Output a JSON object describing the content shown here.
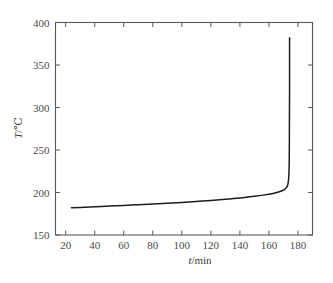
{
  "figure": {
    "background_color": "#ffffff",
    "axis_color": "#585858",
    "curve_color": "#1d1d1d"
  },
  "chart_data": {
    "type": "line",
    "title": "",
    "xlabel": "t/min",
    "ylabel": "T/℃",
    "xlabel_parts": {
      "symbol": "t",
      "unit": "/min"
    },
    "ylabel_parts": {
      "symbol": "T",
      "unit": "/℃"
    },
    "xlim": [
      13,
      190
    ],
    "ylim": [
      150,
      400
    ],
    "xticks": [
      20,
      40,
      60,
      80,
      100,
      120,
      140,
      160,
      180
    ],
    "xtick_labels": [
      "20",
      "40",
      "60",
      "80",
      "100",
      "120",
      "140",
      "160",
      "180"
    ],
    "yticks": [
      150,
      200,
      250,
      300,
      350,
      400
    ],
    "ytick_labels": [
      "150",
      "200",
      "250",
      "300",
      "350",
      "400"
    ],
    "grid": false,
    "legend": false,
    "tick_direction": "in",
    "series": [
      {
        "name": "temperature-vs-time",
        "x": [
          24,
          30,
          40,
          50,
          60,
          70,
          80,
          90,
          100,
          110,
          120,
          130,
          140,
          150,
          157,
          162,
          166,
          169,
          171,
          172.4,
          173.2,
          173.7,
          174,
          174.1,
          174.2,
          174.2,
          174.2
        ],
        "y": [
          182,
          182.4,
          183.2,
          184.0,
          184.8,
          185.6,
          186.4,
          187.3,
          188.3,
          189.4,
          190.6,
          192.0,
          193.6,
          195.6,
          197.2,
          198.6,
          200.2,
          202.0,
          204.0,
          206.5,
          211,
          220,
          240,
          280,
          320,
          355,
          382
        ]
      }
    ]
  }
}
